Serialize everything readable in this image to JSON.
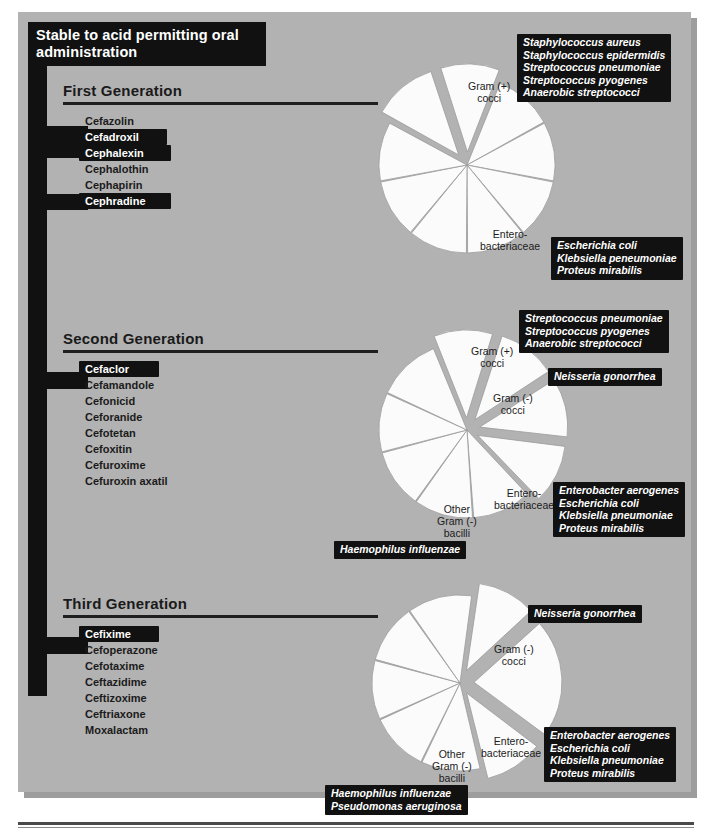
{
  "title": "Stable to acid permitting oral administration",
  "generations": [
    {
      "name": "First Generation",
      "drugs": [
        {
          "label": "Cefazolin",
          "highlighted": false
        },
        {
          "label": "Cefadroxil",
          "highlighted": true
        },
        {
          "label": "Cephalexin",
          "highlighted": true
        },
        {
          "label": "Cephalothin",
          "highlighted": false
        },
        {
          "label": "Cephapirin",
          "highlighted": false
        },
        {
          "label": "Cephradine",
          "highlighted": true
        }
      ]
    },
    {
      "name": "Second Generation",
      "drugs": [
        {
          "label": "Cefaclor",
          "highlighted": true
        },
        {
          "label": "Cefamandole",
          "highlighted": false
        },
        {
          "label": "Cefonicid",
          "highlighted": false
        },
        {
          "label": "Ceforanide",
          "highlighted": false
        },
        {
          "label": "Cefotetan",
          "highlighted": false
        },
        {
          "label": "Cefoxitin",
          "highlighted": false
        },
        {
          "label": "Cefuroxime",
          "highlighted": false
        },
        {
          "label": "Cefuroxin axatil",
          "highlighted": false
        }
      ]
    },
    {
      "name": "Third Generation",
      "drugs": [
        {
          "label": "Cefixime",
          "highlighted": true
        },
        {
          "label": "Cefoperazone",
          "highlighted": false
        },
        {
          "label": "Cefotaxime",
          "highlighted": false
        },
        {
          "label": "Ceftazidime",
          "highlighted": false
        },
        {
          "label": "Ceftizoxime",
          "highlighted": false
        },
        {
          "label": "Ceftriaxone",
          "highlighted": false
        },
        {
          "label": "Moxalactam",
          "highlighted": false
        }
      ]
    }
  ],
  "pie1": {
    "leaders": [
      {
        "lines": [
          "Gram (+)",
          "cocci"
        ]
      },
      {
        "lines": [
          "Entero-",
          "bacteriaceae"
        ]
      }
    ],
    "callouts": [
      {
        "lines": [
          "Staphylococcus aureus",
          "Staphylococcus epidermidis",
          "Streptococcus pneumoniae",
          "Streptococcus pyogenes",
          "Anaerobic streptococci"
        ]
      },
      {
        "lines": [
          "Escherichia coli",
          "Klebsiella peneumoniae",
          "Proteus mirabilis"
        ]
      }
    ]
  },
  "pie2": {
    "leaders": [
      {
        "lines": [
          "Gram (+)",
          "cocci"
        ]
      },
      {
        "lines": [
          "Gram (-)",
          "cocci"
        ]
      },
      {
        "lines": [
          "Entero-",
          "bacteriaceae"
        ]
      },
      {
        "lines": [
          "Other",
          "Gram (-)",
          "bacilli"
        ]
      }
    ],
    "callouts": [
      {
        "lines": [
          "Streptococcus pneumoniae",
          "Streptococcus pyogenes",
          "Anaerobic streptococci"
        ]
      },
      {
        "lines": [
          "Neisseria gonorrhea"
        ]
      },
      {
        "lines": [
          "Enterobacter aerogenes",
          "Escherichia coli",
          "Klebsiella pneumoniae",
          "Proteus mirabilis"
        ]
      },
      {
        "lines": [
          "Haemophilus influenzae"
        ]
      }
    ]
  },
  "pie3": {
    "leaders": [
      {
        "lines": [
          "Gram (-)",
          "cocci"
        ]
      },
      {
        "lines": [
          "Entero-",
          "bacteriaceae"
        ]
      },
      {
        "lines": [
          "Other",
          "Gram (-)",
          "bacilli"
        ]
      }
    ],
    "callouts": [
      {
        "lines": [
          "Neisseria gonorrhea"
        ]
      },
      {
        "lines": [
          "Enterobacter aerogenes",
          "Escherichia coli",
          "Klebsiella pneumoniae",
          "Proteus mirabilis"
        ]
      },
      {
        "lines": [
          "Haemophilus influenzae",
          "Pseudomonas aeruginosa"
        ]
      }
    ]
  },
  "chart_data": [
    {
      "type": "pie",
      "title": "First Generation spectrum",
      "categories": [
        "Gram (+) cocci",
        "s2",
        "s3",
        "s4",
        "s5",
        "s6",
        "s7",
        "s8",
        "Enterobacteriaceae"
      ],
      "values": [
        11,
        11,
        11,
        11,
        11,
        11,
        11,
        11,
        12
      ],
      "exploded": [
        "Gram (+) cocci",
        "Enterobacteriaceae"
      ]
    },
    {
      "type": "pie",
      "title": "Second Generation spectrum",
      "categories": [
        "Gram (+) cocci",
        "Gram (-) cocci",
        "Enterobacteriaceae",
        "Other Gram (-) bacilli",
        "s5",
        "s6",
        "s7",
        "s8",
        "s9"
      ],
      "values": [
        11,
        11,
        11,
        11,
        11,
        11,
        11,
        11,
        12
      ],
      "exploded": [
        "Gram (+) cocci",
        "Gram (-) cocci",
        "Enterobacteriaceae",
        "Other Gram (-) bacilli"
      ]
    },
    {
      "type": "pie",
      "title": "Third Generation spectrum",
      "categories": [
        "Gram (-) cocci",
        "Enterobacteriaceae",
        "Other Gram (-) bacilli",
        "s4",
        "s5",
        "s6",
        "s7",
        "s8"
      ],
      "values": [
        11,
        22,
        11,
        11,
        11,
        11,
        11,
        12
      ],
      "exploded": [
        "Gram (-) cocci",
        "Enterobacteriaceae",
        "Other Gram (-) bacilli"
      ]
    }
  ],
  "colors": {
    "panel": "#b2b2b2",
    "ink": "#111111",
    "slice": "#fbfbfb",
    "slice_stroke": "#9a9a9a"
  }
}
